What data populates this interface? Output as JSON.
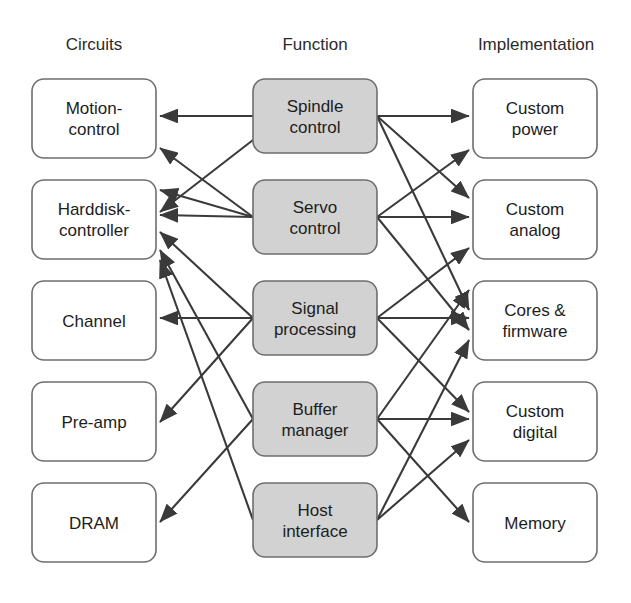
{
  "diagram": {
    "title_columns": [
      {
        "id": "circuits",
        "label": "Circuits",
        "x": 94
      },
      {
        "id": "function",
        "label": "Function",
        "x": 315
      },
      {
        "id": "implementation",
        "label": "Implementation",
        "x": 536
      }
    ],
    "style": {
      "plain_fill": "#ffffff",
      "shaded_fill": "#d2d2d2",
      "border_color": "#6e6e6e",
      "edge_color": "#3a3a3a",
      "text_color": "#1d1d1d",
      "background": "#ffffff"
    },
    "columns": {
      "circuits": {
        "x": 32,
        "width": 124,
        "nodes": [
          {
            "id": "motion-control",
            "lines": [
              "Motion-",
              "control"
            ],
            "y": 79,
            "height": 79,
            "shaded": false
          },
          {
            "id": "harddisk-controller",
            "lines": [
              "Harddisk-",
              "controller"
            ],
            "y": 180,
            "height": 79,
            "shaded": false
          },
          {
            "id": "channel",
            "lines": [
              "Channel"
            ],
            "y": 281,
            "height": 79,
            "shaded": false
          },
          {
            "id": "pre-amp",
            "lines": [
              "Pre-amp"
            ],
            "y": 382,
            "height": 79,
            "shaded": false
          },
          {
            "id": "dram",
            "lines": [
              "DRAM"
            ],
            "y": 483,
            "height": 79,
            "shaded": false
          }
        ]
      },
      "function": {
        "x": 253,
        "width": 124,
        "nodes": [
          {
            "id": "spindle-control",
            "lines": [
              "Spindle",
              "control"
            ],
            "y": 79,
            "height": 74,
            "shaded": true
          },
          {
            "id": "servo-control",
            "lines": [
              "Servo",
              "control"
            ],
            "y": 180,
            "height": 74,
            "shaded": true
          },
          {
            "id": "signal-processing",
            "lines": [
              "Signal",
              "processing"
            ],
            "y": 281,
            "height": 74,
            "shaded": true
          },
          {
            "id": "buffer-manager",
            "lines": [
              "Buffer",
              "manager"
            ],
            "y": 382,
            "height": 74,
            "shaded": true
          },
          {
            "id": "host-interface",
            "lines": [
              "Host",
              "interface"
            ],
            "y": 483,
            "height": 74,
            "shaded": true
          }
        ]
      },
      "implementation": {
        "x": 473,
        "width": 124,
        "nodes": [
          {
            "id": "custom-power",
            "lines": [
              "Custom",
              "power"
            ],
            "y": 79,
            "height": 79,
            "shaded": false
          },
          {
            "id": "custom-analog",
            "lines": [
              "Custom",
              "analog"
            ],
            "y": 180,
            "height": 79,
            "shaded": false
          },
          {
            "id": "cores-firmware",
            "lines": [
              "Cores &",
              "firmware"
            ],
            "y": 281,
            "height": 79,
            "shaded": false
          },
          {
            "id": "custom-digital",
            "lines": [
              "Custom",
              "digital"
            ],
            "y": 382,
            "height": 79,
            "shaded": false
          },
          {
            "id": "memory",
            "lines": [
              "Memory"
            ],
            "y": 483,
            "height": 79,
            "shaded": false
          }
        ]
      }
    },
    "edges": [
      {
        "id": "spindle-to-motion-control",
        "from": "spindle-control",
        "to": "motion-control",
        "x1": 253,
        "y1": 116,
        "x2": 160,
        "y2": 116
      },
      {
        "id": "spindle-to-harddisk-controller",
        "from": "spindle-control",
        "to": "harddisk-controller",
        "x1": 253,
        "y1": 140,
        "x2": 160,
        "y2": 212
      },
      {
        "id": "servo-to-motion-control",
        "from": "servo-control",
        "to": "motion-control",
        "x1": 253,
        "y1": 217,
        "x2": 160,
        "y2": 148
      },
      {
        "id": "servo-to-harddisk-controller-a",
        "from": "servo-control",
        "to": "harddisk-controller",
        "x1": 253,
        "y1": 217,
        "x2": 160,
        "y2": 190
      },
      {
        "id": "servo-to-harddisk-controller-b",
        "from": "servo-control",
        "to": "harddisk-controller",
        "x1": 253,
        "y1": 217,
        "x2": 160,
        "y2": 215
      },
      {
        "id": "signal-to-harddisk-controller",
        "from": "signal-processing",
        "to": "harddisk-controller",
        "x1": 253,
        "y1": 318,
        "x2": 160,
        "y2": 232
      },
      {
        "id": "signal-to-channel",
        "from": "signal-processing",
        "to": "channel",
        "x1": 253,
        "y1": 318,
        "x2": 160,
        "y2": 318
      },
      {
        "id": "signal-to-pre-amp",
        "from": "signal-processing",
        "to": "pre-amp",
        "x1": 253,
        "y1": 318,
        "x2": 160,
        "y2": 422
      },
      {
        "id": "buffer-to-harddisk-controller",
        "from": "buffer-manager",
        "to": "harddisk-controller",
        "x1": 253,
        "y1": 419,
        "x2": 160,
        "y2": 250
      },
      {
        "id": "buffer-to-dram",
        "from": "buffer-manager",
        "to": "dram",
        "x1": 253,
        "y1": 419,
        "x2": 160,
        "y2": 522
      },
      {
        "id": "host-to-harddisk-controller",
        "from": "host-interface",
        "to": "harddisk-controller",
        "x1": 253,
        "y1": 520,
        "x2": 160,
        "y2": 260
      },
      {
        "id": "spindle-to-custom-power",
        "from": "spindle-control",
        "to": "custom-power",
        "x1": 377,
        "y1": 116,
        "x2": 469,
        "y2": 116
      },
      {
        "id": "spindle-to-custom-analog",
        "from": "spindle-control",
        "to": "custom-analog",
        "x1": 377,
        "y1": 116,
        "x2": 469,
        "y2": 198
      },
      {
        "id": "spindle-to-cores-firmware",
        "from": "spindle-control",
        "to": "cores-firmware",
        "x1": 377,
        "y1": 116,
        "x2": 469,
        "y2": 310
      },
      {
        "id": "servo-to-custom-power",
        "from": "servo-control",
        "to": "custom-power",
        "x1": 377,
        "y1": 217,
        "x2": 469,
        "y2": 150
      },
      {
        "id": "servo-to-custom-analog",
        "from": "servo-control",
        "to": "custom-analog",
        "x1": 377,
        "y1": 217,
        "x2": 469,
        "y2": 217
      },
      {
        "id": "servo-to-cores-firmware",
        "from": "servo-control",
        "to": "cores-firmware",
        "x1": 377,
        "y1": 217,
        "x2": 469,
        "y2": 330
      },
      {
        "id": "signal-to-custom-analog",
        "from": "signal-processing",
        "to": "custom-analog",
        "x1": 377,
        "y1": 318,
        "x2": 469,
        "y2": 248
      },
      {
        "id": "signal-to-cores-firmware",
        "from": "signal-processing",
        "to": "cores-firmware",
        "x1": 377,
        "y1": 318,
        "x2": 469,
        "y2": 318
      },
      {
        "id": "signal-to-custom-digital",
        "from": "signal-processing",
        "to": "custom-digital",
        "x1": 377,
        "y1": 318,
        "x2": 469,
        "y2": 412
      },
      {
        "id": "buffer-to-cores-firmware",
        "from": "buffer-manager",
        "to": "cores-firmware",
        "x1": 377,
        "y1": 419,
        "x2": 469,
        "y2": 290
      },
      {
        "id": "buffer-to-custom-digital",
        "from": "buffer-manager",
        "to": "custom-digital",
        "x1": 377,
        "y1": 419,
        "x2": 469,
        "y2": 419
      },
      {
        "id": "buffer-to-memory",
        "from": "buffer-manager",
        "to": "memory",
        "x1": 377,
        "y1": 419,
        "x2": 469,
        "y2": 522
      },
      {
        "id": "host-to-cores-firmware",
        "from": "host-interface",
        "to": "cores-firmware",
        "x1": 377,
        "y1": 520,
        "x2": 469,
        "y2": 340
      },
      {
        "id": "host-to-custom-digital",
        "from": "host-interface",
        "to": "custom-digital",
        "x1": 377,
        "y1": 520,
        "x2": 469,
        "y2": 440
      }
    ]
  }
}
